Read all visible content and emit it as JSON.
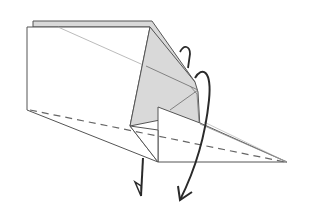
{
  "diagram": {
    "type": "origami-fold-step",
    "colors": {
      "paper_white": "#ffffff",
      "paper_gray": "#d9d9d9",
      "edge_stroke": "#555555",
      "light_crease": "#9a9a9a",
      "dashed_valley": "#666666",
      "arrow": "#2a2a2a"
    },
    "elements": [
      {
        "name": "left-panel",
        "fill": "white"
      },
      {
        "name": "top-gray-strip",
        "fill": "gray"
      },
      {
        "name": "gray-pocket",
        "fill": "gray"
      },
      {
        "name": "front-triangle-flap",
        "fill": "white"
      },
      {
        "name": "right-point",
        "fill": "white"
      },
      {
        "name": "valley-fold-line",
        "style": "dashed"
      },
      {
        "name": "fold-arrow-short",
        "direction": "down"
      },
      {
        "name": "fold-arrow-long-curved",
        "direction": "down-over"
      }
    ]
  }
}
